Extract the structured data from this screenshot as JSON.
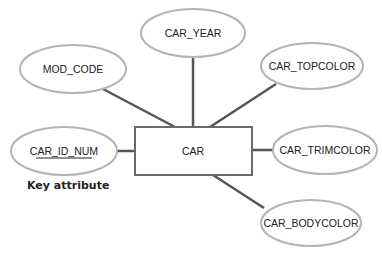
{
  "diagram": {
    "type": "ER attribute diagram",
    "entity": {
      "label": "CAR"
    },
    "attributes": [
      {
        "id": "car_year",
        "label": "CAR_YEAR",
        "key": false
      },
      {
        "id": "mod_code",
        "label": "MOD_CODE",
        "key": false
      },
      {
        "id": "car_topcolor",
        "label": "CAR_TOPCOLOR",
        "key": false
      },
      {
        "id": "car_id_num",
        "label": "CAR_ID_NUM",
        "key": true
      },
      {
        "id": "car_trimcolor",
        "label": "CAR_TRIMCOLOR",
        "key": false
      },
      {
        "id": "car_bodycolor",
        "label": "CAR_BODYCOLOR",
        "key": false
      }
    ],
    "annotations": {
      "key_attribute_label": "Key attribute"
    },
    "colors": {
      "ellipse_stroke": "#b4b4b4",
      "box_stroke": "#6a6a6a",
      "line": "#555555",
      "text": "#222222"
    }
  }
}
